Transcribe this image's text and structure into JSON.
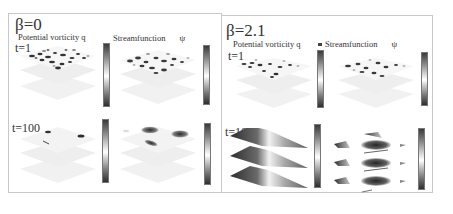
{
  "figure": {
    "left": {
      "beta_label": "β=0",
      "pv_title": "Potential vorticity q",
      "sf_title": "Streamfunction",
      "sf_symbol": "ψ",
      "rows": [
        {
          "time_label": "t=1"
        },
        {
          "time_label": "t=100"
        }
      ]
    },
    "right": {
      "beta_label": "β=2.1",
      "pv_title": "Potential vorticity q",
      "sf_title": "Streamfunction",
      "sf_symbol": "ψ",
      "rows": [
        {
          "time_label": "t=1"
        },
        {
          "time_label": "t=100"
        }
      ]
    },
    "colors": {
      "frame": "#c8c8c8",
      "layer_faint": "#ececec",
      "dark_feature": "#2e2e2e",
      "mid_gray": "#8a8a8a"
    }
  }
}
